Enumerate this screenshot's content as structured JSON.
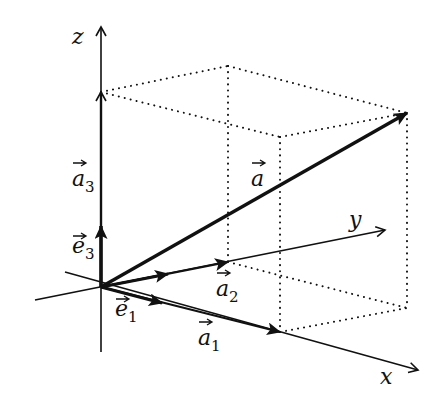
{
  "diagram": {
    "colors": {
      "ink": "#111111",
      "background": "#ffffff"
    },
    "axes": {
      "x": {
        "label": "x"
      },
      "y": {
        "label": "y"
      },
      "z": {
        "label": "z"
      }
    },
    "vectors": {
      "a": {
        "base": "a",
        "sub": ""
      },
      "a1": {
        "base": "a",
        "sub": "1"
      },
      "a2": {
        "base": "a",
        "sub": "2"
      },
      "a3": {
        "base": "a",
        "sub": "3"
      },
      "e1": {
        "base": "e",
        "sub": "1"
      },
      "e3": {
        "base": "e",
        "sub": "3"
      }
    }
  }
}
